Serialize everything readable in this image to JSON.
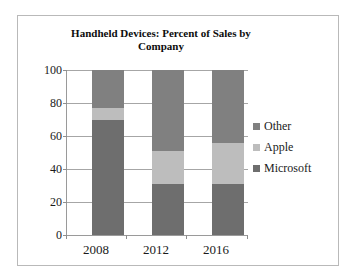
{
  "chart_data": {
    "type": "bar",
    "subtype": "stacked-100-percent",
    "title": "Handheld Devices: Percent of Sales by Company",
    "title_line1": "Handheld Devices: Percent of Sales by",
    "title_line2": "Company",
    "xlabel": "",
    "ylabel": "",
    "categories": [
      "2008",
      "2012",
      "2016"
    ],
    "yticks": [
      "100",
      "80",
      "60",
      "40",
      "20",
      "0"
    ],
    "ylim": [
      0,
      100
    ],
    "grid": true,
    "legend_position": "right",
    "series": [
      {
        "name": "Other",
        "color": "#808080",
        "values": [
          23,
          49,
          44
        ]
      },
      {
        "name": "Apple",
        "color": "#bdbdbd",
        "values": [
          7,
          20,
          25
        ]
      },
      {
        "name": "Microsoft",
        "color": "#6e6e6e",
        "values": [
          70,
          31,
          31
        ]
      }
    ],
    "stack_order_bottom_to_top": [
      "Microsoft",
      "Apple",
      "Other"
    ],
    "cumulative_tops": {
      "2008": {
        "Microsoft": 70,
        "Apple": 77,
        "Other": 100
      },
      "2012": {
        "Microsoft": 31,
        "Apple": 51,
        "Other": 100
      },
      "2016": {
        "Microsoft": 31,
        "Apple": 56,
        "Other": 100
      }
    }
  },
  "legend": {
    "items": [
      {
        "label": "Other",
        "color": "#808080"
      },
      {
        "label": "Apple",
        "color": "#bdbdbd"
      },
      {
        "label": "Microsoft",
        "color": "#6e6e6e"
      }
    ]
  },
  "colors": {
    "frame_border": "#b9b9b9",
    "gridline": "#a6a6a6",
    "axis": "#9a9a9a",
    "text": "#1a1a1a",
    "background": "#ffffff"
  }
}
